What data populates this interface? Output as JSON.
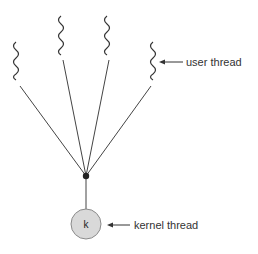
{
  "diagram": {
    "labels": {
      "user_thread": "user thread",
      "kernel_thread": "kernel thread",
      "kernel_node": "k"
    },
    "user_threads": [
      {
        "id": 1,
        "x": 16,
        "top": 42,
        "bottom": 80
      },
      {
        "id": 2,
        "x": 61,
        "top": 16,
        "bottom": 55
      },
      {
        "id": 3,
        "x": 107,
        "top": 16,
        "bottom": 55
      },
      {
        "id": 4,
        "x": 153,
        "top": 42,
        "bottom": 80
      }
    ],
    "junction": {
      "x": 86,
      "y": 176
    },
    "kernel": {
      "x": 86,
      "y": 224,
      "r": 15
    },
    "colors": {
      "line": "#333333",
      "kernel_fill": "#d9d9d9",
      "kernel_stroke": "#8a8a8a",
      "text": "#333333"
    }
  }
}
